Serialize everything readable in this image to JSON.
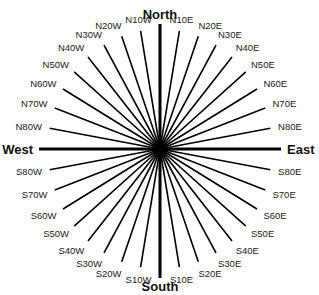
{
  "diagram": {
    "center": {
      "x": 160,
      "y": 149
    },
    "colors": {
      "line": "#000000",
      "text": "#111111",
      "background": "#ffffff"
    },
    "cardinals": [
      {
        "label": "North",
        "angle": 0
      },
      {
        "label": "East",
        "angle": 90
      },
      {
        "label": "South",
        "angle": 180
      },
      {
        "label": "West",
        "angle": 270
      }
    ],
    "bearings": [
      {
        "label": "N10E",
        "angle": 10
      },
      {
        "label": "N20E",
        "angle": 20
      },
      {
        "label": "N30E",
        "angle": 30
      },
      {
        "label": "N40E",
        "angle": 40
      },
      {
        "label": "N50E",
        "angle": 50
      },
      {
        "label": "N60E",
        "angle": 60
      },
      {
        "label": "N70E",
        "angle": 70
      },
      {
        "label": "N80E",
        "angle": 80
      },
      {
        "label": "S80E",
        "angle": 100
      },
      {
        "label": "S70E",
        "angle": 110
      },
      {
        "label": "S60E",
        "angle": 120
      },
      {
        "label": "S50E",
        "angle": 130
      },
      {
        "label": "S40E",
        "angle": 140
      },
      {
        "label": "S30E",
        "angle": 150
      },
      {
        "label": "S20E",
        "angle": 160
      },
      {
        "label": "S10E",
        "angle": 170
      },
      {
        "label": "S10W",
        "angle": 190
      },
      {
        "label": "S20W",
        "angle": 200
      },
      {
        "label": "S30W",
        "angle": 210
      },
      {
        "label": "S40W",
        "angle": 220
      },
      {
        "label": "S50W",
        "angle": 230
      },
      {
        "label": "S60W",
        "angle": 240
      },
      {
        "label": "S70W",
        "angle": 250
      },
      {
        "label": "S80W",
        "angle": 260
      },
      {
        "label": "N80W",
        "angle": 280
      },
      {
        "label": "N70W",
        "angle": 290
      },
      {
        "label": "N60W",
        "angle": 300
      },
      {
        "label": "N50W",
        "angle": 310
      },
      {
        "label": "N40W",
        "angle": 320
      },
      {
        "label": "N30W",
        "angle": 330
      },
      {
        "label": "N20W",
        "angle": 340
      },
      {
        "label": "N10W",
        "angle": 350
      }
    ]
  }
}
